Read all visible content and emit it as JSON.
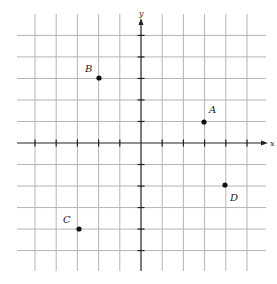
{
  "diagram": {
    "type": "coordinate-plane",
    "axes": {
      "x_label": "x",
      "y_label": "y"
    },
    "grid": {
      "x_range": [
        -5,
        5
      ],
      "y_range": [
        -5,
        5
      ],
      "spacing": 1
    },
    "points": [
      {
        "label": "A",
        "x": 3,
        "y": 1
      },
      {
        "label": "B",
        "x": -2,
        "y": 3
      },
      {
        "label": "C",
        "x": -3,
        "y": -4
      },
      {
        "label": "D",
        "x": 4,
        "y": -2
      }
    ],
    "colors": {
      "grid": "#b5b5b5",
      "axis": "#222222",
      "point": "#111111",
      "background": "#ffffff"
    }
  }
}
